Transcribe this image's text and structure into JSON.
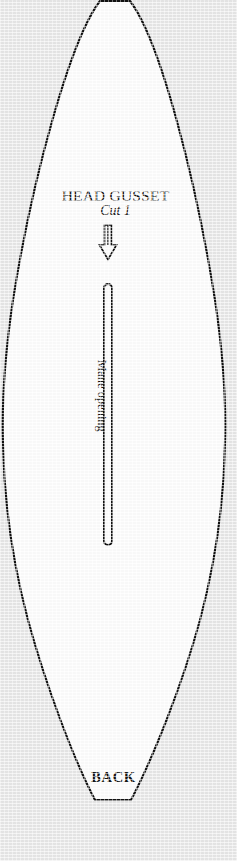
{
  "document": {
    "type": "sewing-pattern-piece",
    "page_background_color": "#e9e9e9",
    "piece_fill_color": "#ffffff",
    "ink_color": "#101010"
  },
  "piece": {
    "title": "HEAD GUSSET",
    "cut_instruction": "Cut 1",
    "orientation_marker": "BACK",
    "grain_arrow_icon": "down-arrow-icon",
    "opening": {
      "label": "Mane opening",
      "shape": "rounded-slot",
      "rotation_degrees": 90
    }
  },
  "geometry": {
    "canvas_width": 237,
    "canvas_height": 861,
    "outline_path": "M 100 1 L 130 1 C 160 40 196 180 215 300 C 224 360 226 410 225 443 C 224 500 216 560 200 620 C 182 686 152 760 131 800 L 95 800 C 74 760 46 686 28 620 C 12 560 4 500 3 443 C 2 410 4 360 13 300 C 32 180 70 40 100 1 Z",
    "slot": {
      "x": 104,
      "y": 284,
      "width": 8,
      "height": 261,
      "radius": 4
    },
    "arrow": {
      "center_x": 108,
      "top_y": 225,
      "bottom_y": 259,
      "shaft_width": 6,
      "head_width": 17
    }
  }
}
